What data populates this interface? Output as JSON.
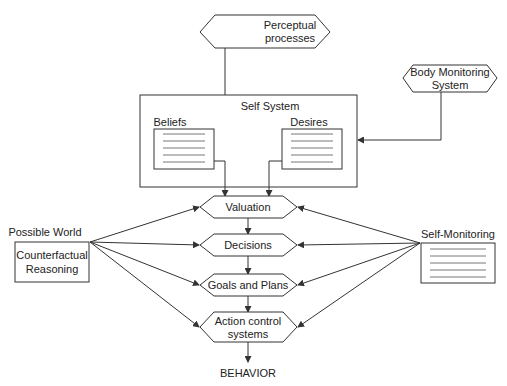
{
  "diagram": {
    "perceptual": {
      "line1": "Perceptual",
      "line2": "processes"
    },
    "self_system": {
      "title": "Self System",
      "beliefs": "Beliefs",
      "desires": "Desires"
    },
    "body_monitoring": {
      "line1": "Body Monitoring",
      "line2": "System"
    },
    "possible_world": {
      "title": "Possible World",
      "line1": "Counterfactual",
      "line2": "Reasoning"
    },
    "self_monitoring": {
      "title": "Self-Monitoring"
    },
    "stages": {
      "valuation": "Valuation",
      "decisions": "Decisions",
      "goals": "Goals and Plans",
      "action_line1": "Action control",
      "action_line2": "systems"
    },
    "output": "BEHAVIOR"
  },
  "colors": {
    "line": "#333333",
    "text": "#222222",
    "background": "#ffffff"
  }
}
